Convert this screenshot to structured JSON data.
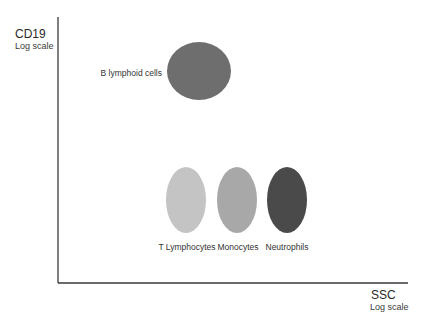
{
  "diagram": {
    "y_axis": {
      "label": "CD19",
      "sublabel": "Log scale"
    },
    "x_axis": {
      "label": "SSC",
      "sublabel": "Log scale"
    },
    "populations": [
      {
        "id": "b-lymphoid",
        "label": "B lymphoid cells",
        "color": "#6e6e6e",
        "shape": "circle",
        "label_position": "left"
      },
      {
        "id": "t-lymphocytes",
        "label": "T Lymphocytes",
        "color": "#c4c4c4",
        "shape": "ellipse",
        "label_position": "below"
      },
      {
        "id": "monocytes",
        "label": "Monocytes",
        "color": "#a8a8a8",
        "shape": "ellipse",
        "label_position": "below"
      },
      {
        "id": "neutrophils",
        "label": "Neutrophils",
        "color": "#4a4a4a",
        "shape": "ellipse",
        "label_position": "below"
      }
    ]
  }
}
